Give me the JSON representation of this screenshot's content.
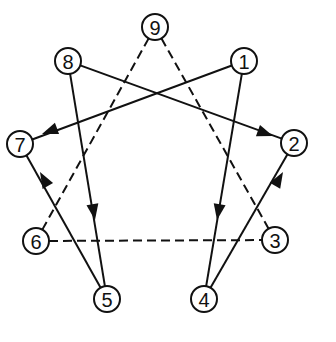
{
  "diagram": {
    "type": "enneagram",
    "node_radius": 13,
    "colors": {
      "stroke": "#111111",
      "background": "#ffffff"
    },
    "nodes": [
      {
        "id": "1",
        "label": "1",
        "x": 244,
        "y": 61
      },
      {
        "id": "2",
        "label": "2",
        "x": 294,
        "y": 143
      },
      {
        "id": "3",
        "label": "3",
        "x": 275,
        "y": 240
      },
      {
        "id": "4",
        "label": "4",
        "x": 204,
        "y": 299
      },
      {
        "id": "5",
        "label": "5",
        "x": 107,
        "y": 299
      },
      {
        "id": "6",
        "label": "6",
        "x": 36,
        "y": 241
      },
      {
        "id": "7",
        "label": "7",
        "x": 20,
        "y": 144
      },
      {
        "id": "8",
        "label": "8",
        "x": 68,
        "y": 61
      },
      {
        "id": "9",
        "label": "9",
        "x": 155,
        "y": 27
      }
    ],
    "solid_edges": [
      {
        "from": "1",
        "to": "4",
        "arrow_tip": [
          217,
          220
        ]
      },
      {
        "from": "4",
        "to": "2",
        "arrow_tip": [
          283,
          172
        ]
      },
      {
        "from": "8",
        "to": "2",
        "arrow_tip": [
          273,
          136
        ]
      },
      {
        "from": "8",
        "to": "5",
        "arrow_tip": [
          95,
          220
        ]
      },
      {
        "from": "5",
        "to": "7",
        "arrow_tip": [
          40,
          172
        ]
      },
      {
        "from": "1",
        "to": "7",
        "arrow_tip": [
          42,
          134
        ]
      }
    ],
    "dashed_edges": [
      {
        "from": "9",
        "to": "3"
      },
      {
        "from": "9",
        "to": "6"
      },
      {
        "from": "6",
        "to": "3"
      }
    ]
  }
}
